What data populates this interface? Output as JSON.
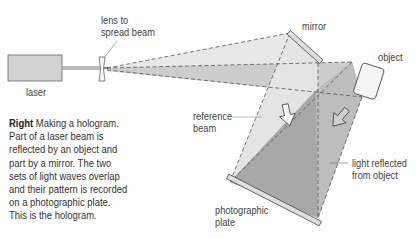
{
  "labels": {
    "lens": [
      "lens to",
      "spread beam"
    ],
    "laser": "laser",
    "mirror": "mirror",
    "object": "object",
    "reference_beam": [
      "reference",
      "beam"
    ],
    "light_reflected": [
      "light reflected",
      "from object"
    ],
    "photographic_plate": [
      "photographic",
      "plate"
    ]
  },
  "caption": {
    "lead": "Right",
    "lines": [
      " Making a hologram.",
      "Part of a laser beam is",
      "reflected by an object and",
      "part by a mirror. The two",
      "sets of light waves overlap",
      "and their pattern is recorded",
      "on a photographic plate.",
      "This is the hologram."
    ]
  },
  "colors": {
    "light_beam": "#e6e6e6",
    "mid_beam": "#c9c9c9",
    "dark_overlap": "#a9a9a9",
    "laser_body": "#d0d0d0",
    "outline": "#555555"
  }
}
